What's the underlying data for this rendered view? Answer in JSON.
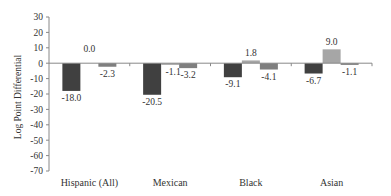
{
  "chart_data": {
    "type": "bar",
    "title": "",
    "xlabel": "",
    "ylabel": "Log Point Differential",
    "ylim": [
      -70,
      30
    ],
    "yticks": [
      30,
      20,
      10,
      0,
      -10,
      -20,
      -30,
      -40,
      -50,
      -60,
      -70
    ],
    "grid": false,
    "legend": null,
    "categories": [
      "Hispanic (All)",
      "Mexican",
      "Black",
      "Asian"
    ],
    "series": [
      {
        "name": "Series 1",
        "color": "#404040",
        "values": [
          -18.0,
          -20.5,
          -9.1,
          -6.7
        ]
      },
      {
        "name": "Series 2",
        "color": "#a6a6a6",
        "values": [
          0.0,
          -1.1,
          1.8,
          9.0
        ]
      },
      {
        "name": "Series 3",
        "color": "#7f7f7f",
        "values": [
          -2.3,
          -3.2,
          -4.1,
          -1.1
        ]
      }
    ],
    "data_labels": [
      [
        "-18.0",
        "0.0",
        "-2.3"
      ],
      [
        "-20.5",
        "-1.1",
        "-3.2"
      ],
      [
        "-9.1",
        "1.8",
        "-4.1"
      ],
      [
        "-6.7",
        "9.0",
        "-1.1"
      ]
    ]
  }
}
